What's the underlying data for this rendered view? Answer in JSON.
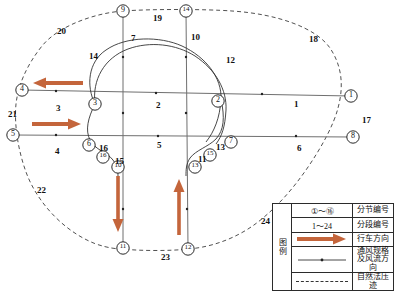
{
  "diagram": {
    "colors": {
      "arrow": "#C4653B",
      "airway": "#6b6b6b",
      "boundary": "#444444",
      "curve": "#333333",
      "text": "#111111"
    },
    "section_nodes": [
      {
        "id": "1",
        "glyph": "①",
        "x": 351,
        "y": 96
      },
      {
        "id": "2",
        "glyph": "②",
        "x": 218,
        "y": 101
      },
      {
        "id": "3",
        "glyph": "③",
        "x": 95,
        "y": 104
      },
      {
        "id": "4",
        "glyph": "④",
        "x": 22,
        "y": 90
      },
      {
        "id": "5",
        "glyph": "⑤",
        "x": 13,
        "y": 135
      },
      {
        "id": "6",
        "glyph": "⑥",
        "x": 89,
        "y": 145
      },
      {
        "id": "7",
        "glyph": "⑦",
        "x": 231,
        "y": 142
      },
      {
        "id": "8",
        "glyph": "⑧",
        "x": 353,
        "y": 137
      },
      {
        "id": "9",
        "glyph": "⑨",
        "x": 123,
        "y": 11
      },
      {
        "id": "10",
        "glyph": "⑩",
        "x": 118,
        "y": 167
      },
      {
        "id": "11",
        "glyph": "⑪",
        "x": 123,
        "y": 248
      },
      {
        "id": "12",
        "glyph": "⑫",
        "x": 188,
        "y": 249
      },
      {
        "id": "13",
        "glyph": "⑬",
        "x": 195,
        "y": 167
      },
      {
        "id": "14",
        "glyph": "⑭",
        "x": 186,
        "y": 11
      },
      {
        "id": "15",
        "glyph": "⑮",
        "x": 210,
        "y": 155
      },
      {
        "id": "16",
        "glyph": "⑯",
        "x": 103,
        "y": 157
      }
    ],
    "segment_labels": [
      {
        "text": "1",
        "x": 294,
        "y": 100
      },
      {
        "text": "2",
        "x": 156,
        "y": 101
      },
      {
        "text": "3",
        "x": 56,
        "y": 104
      },
      {
        "text": "4",
        "x": 55,
        "y": 147
      },
      {
        "text": "5",
        "x": 157,
        "y": 141
      },
      {
        "text": "6",
        "x": 297,
        "y": 144
      },
      {
        "text": "7",
        "x": 131,
        "y": 34
      },
      {
        "text": "10",
        "x": 191,
        "y": 33
      },
      {
        "text": "11",
        "x": 198,
        "y": 155
      },
      {
        "text": "12",
        "x": 226,
        "y": 56
      },
      {
        "text": "13",
        "x": 216,
        "y": 143
      },
      {
        "text": "14",
        "x": 89,
        "y": 52
      },
      {
        "text": "15",
        "x": 115,
        "y": 157
      },
      {
        "text": "16",
        "x": 99,
        "y": 144
      },
      {
        "text": "17",
        "x": 362,
        "y": 116
      },
      {
        "text": "18",
        "x": 309,
        "y": 35
      },
      {
        "text": "19",
        "x": 153,
        "y": 14
      },
      {
        "text": "20",
        "x": 57,
        "y": 27
      },
      {
        "text": "21",
        "x": 8,
        "y": 110
      },
      {
        "text": "22",
        "x": 37,
        "y": 186
      },
      {
        "text": "23",
        "x": 161,
        "y": 253
      },
      {
        "text": "24",
        "x": 261,
        "y": 217
      }
    ],
    "traffic_arrows": [
      {
        "name": "arrow-left-upper",
        "direction": "left",
        "x1": 83,
        "y1": 83,
        "x2": 35,
        "y2": 83
      },
      {
        "name": "arrow-right-lower",
        "direction": "right",
        "x1": 32,
        "y1": 124,
        "x2": 80,
        "y2": 124
      },
      {
        "name": "arrow-down-left",
        "direction": "down",
        "x1": 118,
        "y1": 176,
        "x2": 118,
        "y2": 231
      },
      {
        "name": "arrow-up-right",
        "direction": "up",
        "x1": 179,
        "y1": 235,
        "x2": 179,
        "y2": 180
      }
    ]
  },
  "legend": {
    "title": "图例",
    "rows": [
      {
        "symbol_type": "circled-range",
        "symbol_text": "①～⑯",
        "label": "分节编号"
      },
      {
        "symbol_type": "plain-range",
        "symbol_text": "1～24",
        "label": "分段编号"
      },
      {
        "symbol_type": "thick-arrow",
        "symbol_text": "",
        "label": "行车方向"
      },
      {
        "symbol_type": "airway-line",
        "symbol_text": "",
        "label": "通风规格及风流方向"
      },
      {
        "symbol_type": "dashed-line",
        "symbol_text": "",
        "label": "自然法压迹"
      }
    ]
  }
}
